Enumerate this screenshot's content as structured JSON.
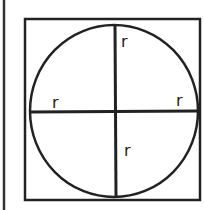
{
  "diagram": {
    "labels": {
      "top": "r",
      "left": "r",
      "right": "r",
      "bottom": "r"
    },
    "stroke_color": "#222222",
    "background": "#ffffff"
  }
}
